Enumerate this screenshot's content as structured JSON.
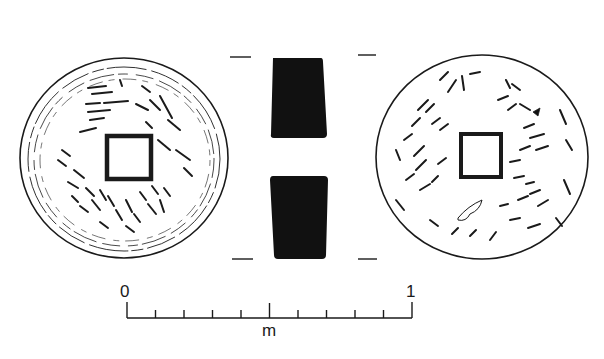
{
  "figure": {
    "type": "archaeological coin drawing",
    "views": [
      {
        "name": "obverse",
        "shape": "round coin with square hole",
        "inscription": "stylized worn characters (illegible)"
      },
      {
        "name": "section",
        "shape": "two solid black profile blocks"
      },
      {
        "name": "reverse",
        "shape": "round coin with square hole, corroded surface"
      }
    ]
  },
  "scale": {
    "start_label": "0",
    "end_label": "1",
    "unit_label": "m",
    "divisions": 10
  },
  "colors": {
    "ink": "#1a1a1a",
    "paper": "#ffffff"
  }
}
